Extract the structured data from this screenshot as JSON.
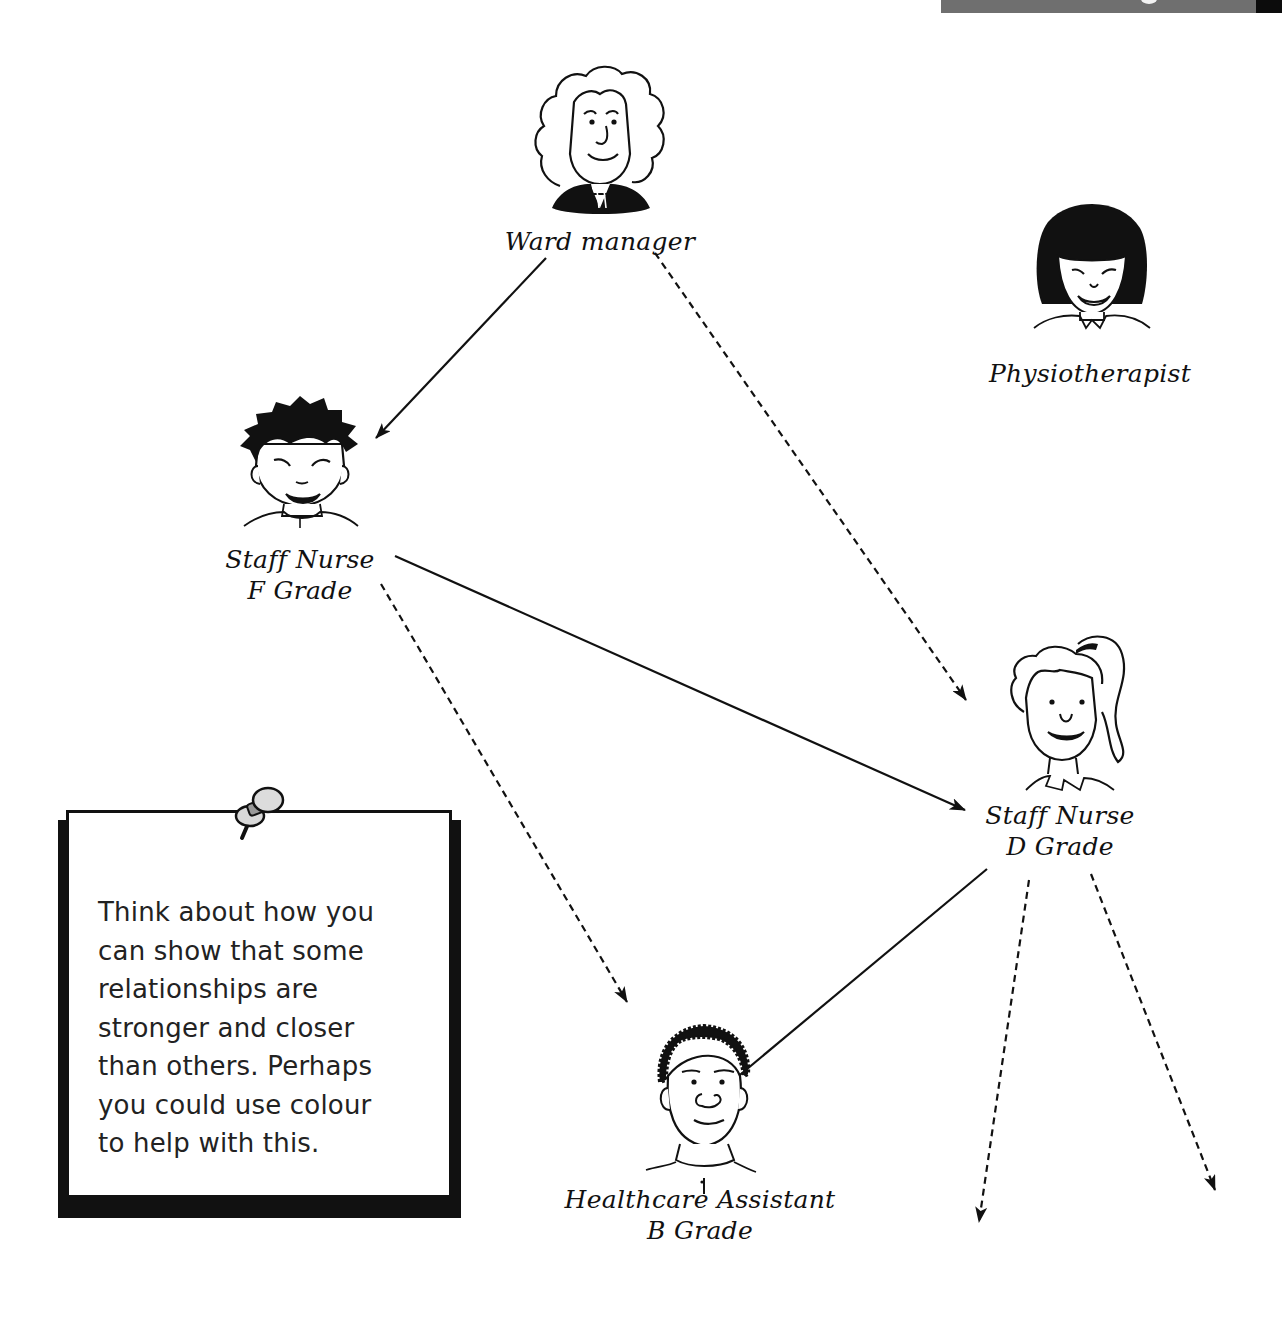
{
  "header": {
    "bar_color": "#6f6f6f",
    "end_block_color": "#0c0c0c"
  },
  "diagram": {
    "type": "relationship-map",
    "line_color": "#111111",
    "legend": {
      "solid_line": "direct relationship",
      "dashed_line": "indirect relationship"
    },
    "nodes": [
      {
        "id": "ward-manager",
        "label_lines": [
          "Ward manager"
        ],
        "icon": "woman-curly-hair-face"
      },
      {
        "id": "physiotherapist",
        "label_lines": [
          "Physiotherapist"
        ],
        "icon": "woman-bob-hair-face"
      },
      {
        "id": "staff-nurse-f",
        "label_lines": [
          "Staff Nurse",
          "F Grade"
        ],
        "icon": "man-spiky-hair-face"
      },
      {
        "id": "staff-nurse-d",
        "label_lines": [
          "Staff Nurse",
          "D Grade"
        ],
        "icon": "woman-ponytail-face"
      },
      {
        "id": "healthcare-assistant-b",
        "label_lines": [
          "Healthcare Assistant",
          "B Grade"
        ],
        "icon": "man-short-curly-hair-face"
      }
    ],
    "edges": [
      {
        "from": "ward-manager",
        "to": "staff-nurse-f",
        "style": "solid"
      },
      {
        "from": "ward-manager",
        "to": "staff-nurse-d",
        "style": "dashed"
      },
      {
        "from": "staff-nurse-f",
        "to": "staff-nurse-d",
        "style": "solid"
      },
      {
        "from": "staff-nurse-f",
        "to": "healthcare-assistant-b",
        "style": "dashed"
      },
      {
        "from": "staff-nurse-d",
        "to": "healthcare-assistant-b",
        "style": "solid"
      },
      {
        "from": "staff-nurse-d",
        "to": "(unlabelled, off-diagram)",
        "style": "dashed"
      },
      {
        "from": "staff-nurse-d",
        "to": "(unlabelled, off-diagram)",
        "style": "dashed"
      }
    ]
  },
  "note": {
    "icon": "push-pin-icon",
    "lines": [
      "Think about how you",
      "can show that some",
      "relationships are",
      "stronger and closer",
      "than others. Perhaps",
      "you could use colour",
      "to help with this."
    ]
  }
}
